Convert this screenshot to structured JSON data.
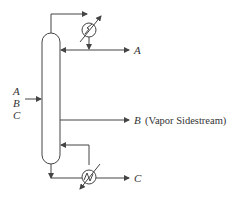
{
  "diagram": {
    "feed": {
      "labels": [
        "A",
        "B",
        "C"
      ]
    },
    "outputs": {
      "top": {
        "label": "A"
      },
      "side": {
        "label": "B",
        "note": "(Vapor Sidestream)"
      },
      "bottom": {
        "label": "C"
      }
    },
    "equipment": {
      "column": "distillation-column",
      "condenser": "condenser",
      "reboiler": "reboiler"
    },
    "colors": {
      "line": "#444444",
      "text": "#333333",
      "background": "#ffffff"
    }
  }
}
